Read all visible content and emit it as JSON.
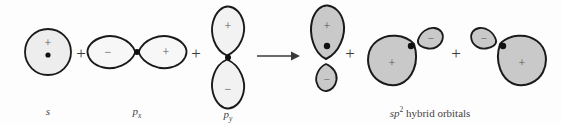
{
  "diagram": {
    "title_text": "sp2 hybridization orbital combination",
    "background_color": "#fdfdfd",
    "stroke_color": "#1a1a1a",
    "fill_light": "#f2f2f2",
    "fill_medium": "#ededed",
    "fill_gray": "#c9c9c9",
    "nucleus_color": "#111111",
    "sign_color": "#555555"
  },
  "operators": {
    "plus_1": "+",
    "plus_2": "+",
    "plus_3": "+",
    "plus_4": "+",
    "arrow": "⟶"
  },
  "reactants": [
    {
      "id": "s-orbital",
      "label_html": "<i>s</i>",
      "label_plain": "s",
      "signs": [
        "+"
      ],
      "shape": "sphere",
      "fill": "#ededed"
    },
    {
      "id": "px-orbital",
      "label_html": "<i>p</i><sub>x</sub>",
      "label_plain": "px",
      "signs": [
        "−",
        "+"
      ],
      "shape": "dumbbell-horizontal",
      "fill": "#f7f7f7"
    },
    {
      "id": "py-orbital",
      "label_html": "<i>p</i><sub>y</sub>",
      "label_plain": "py",
      "signs": [
        "+",
        "−"
      ],
      "shape": "dumbbell-vertical",
      "fill": "#f2f2f2"
    }
  ],
  "products": {
    "label_html": "<i>sp</i><sup>2</sup> hybrid orbitals",
    "label_plain": "sp2 hybrid orbitals",
    "orbitals": [
      {
        "id": "hybrid-1",
        "orientation": "up",
        "major_sign": "+",
        "minor_sign": "−",
        "fill": "#c9c9c9"
      },
      {
        "id": "hybrid-2",
        "orientation": "lower-left",
        "major_sign": "+",
        "minor_sign": "−",
        "fill": "#c9c9c9"
      },
      {
        "id": "hybrid-3",
        "orientation": "lower-right",
        "major_sign": "+",
        "minor_sign": "−",
        "fill": "#c9c9c9"
      }
    ]
  }
}
